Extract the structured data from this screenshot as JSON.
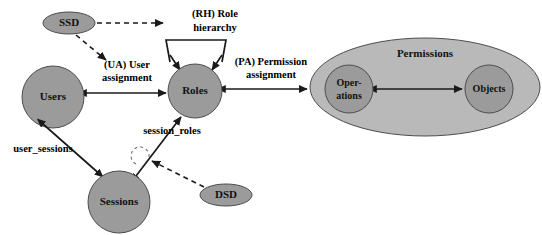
{
  "diagram": {
    "type": "entity-relationship",
    "canvas": {
      "width": 542,
      "height": 235,
      "background": "#ffffff"
    },
    "colors": {
      "node_fill": "#9b9b9b",
      "node_fill_light": "#b9b9b9",
      "node_stroke": "#4d4d4d",
      "edge": "#1a1a1a",
      "text": "#000000"
    }
  },
  "nodes": {
    "ssd": {
      "label": "SSD",
      "shape": "ellipse",
      "cx": 69,
      "cy": 23,
      "rx": 26,
      "ry": 11,
      "fill": "#9b9b9b",
      "font_size": 11
    },
    "users": {
      "label": "Users",
      "shape": "circle",
      "cx": 53,
      "cy": 97,
      "r": 31,
      "fill": "#9b9b9b",
      "font_size": 11
    },
    "roles": {
      "label": "Roles",
      "shape": "circle",
      "cx": 195,
      "cy": 91,
      "r": 27,
      "fill": "#9b9b9b",
      "font_size": 11
    },
    "sessions": {
      "label": "Sessions",
      "shape": "circle",
      "cx": 119,
      "cy": 202,
      "r": 31,
      "fill": "#9b9b9b",
      "font_size": 11
    },
    "dsd": {
      "label": "DSD",
      "shape": "ellipse",
      "cx": 226,
      "cy": 195,
      "rx": 26,
      "ry": 11,
      "fill": "#9b9b9b",
      "font_size": 11
    },
    "permissions": {
      "label": "Permissions",
      "shape": "ellipse",
      "cx": 425,
      "cy": 87,
      "rx": 115,
      "ry": 49,
      "fill": "#b9b9b9",
      "font_size": 11,
      "label_x": 425,
      "label_y": 54
    },
    "operations": {
      "label_line1": "Oper-",
      "label_line2": "ations",
      "shape": "circle",
      "cx": 349,
      "cy": 89,
      "r": 24,
      "fill": "#9b9b9b",
      "font_size": 10
    },
    "objects": {
      "label": "Objects",
      "shape": "circle",
      "cx": 489,
      "cy": 89,
      "r": 24,
      "fill": "#9b9b9b",
      "font_size": 10
    },
    "role_hierarchy": {
      "shape": "trapezoid",
      "points": "166,40 226,40 218,63 174,63"
    }
  },
  "edges": [
    {
      "id": "ua",
      "label_line1": "(UA) User",
      "label_line2": "assignment",
      "label_x": 127,
      "label_y1": 68,
      "label_y2": 81,
      "from": "users",
      "to": "roles",
      "style": "solid",
      "arrows": "both"
    },
    {
      "id": "pa",
      "label_line1": "(PA) Permission",
      "label_line2": "assignment",
      "label_x": 271,
      "label_y1": 65,
      "label_y2": 78,
      "from": "roles",
      "to": "permissions",
      "style": "solid",
      "arrows": "both"
    },
    {
      "id": "rh",
      "label_line1": "(RH) Role",
      "label_line2": "hierarchy",
      "label_x": 215,
      "label_y1": 17,
      "label_y2": 31,
      "from": "role_hierarchy",
      "to": "roles",
      "style": "solid",
      "arrows": "both-down"
    },
    {
      "id": "user_sessions",
      "label": "user_sessions",
      "label_x": 43,
      "label_y": 152,
      "from": "users",
      "to": "sessions",
      "style": "solid",
      "arrows": "both"
    },
    {
      "id": "session_roles",
      "label": "session_roles",
      "label_x": 210,
      "label_y": 134,
      "from": "sessions",
      "to": "roles",
      "style": "solid",
      "arrows": "both"
    },
    {
      "id": "ssd_roles",
      "label": "",
      "from": "ssd",
      "to": "role_hierarchy",
      "style": "dashed",
      "arrows": "end"
    },
    {
      "id": "ssd_ua",
      "label": "",
      "from": "ssd",
      "to": "ua",
      "style": "dashed",
      "arrows": "end"
    },
    {
      "id": "dsd_session_roles",
      "label": "",
      "from": "dsd",
      "to": "session_roles",
      "style": "dashed",
      "arrows": "end"
    },
    {
      "id": "ops_objs",
      "label": "",
      "from": "operations",
      "to": "objects",
      "style": "solid",
      "arrows": "both"
    }
  ]
}
